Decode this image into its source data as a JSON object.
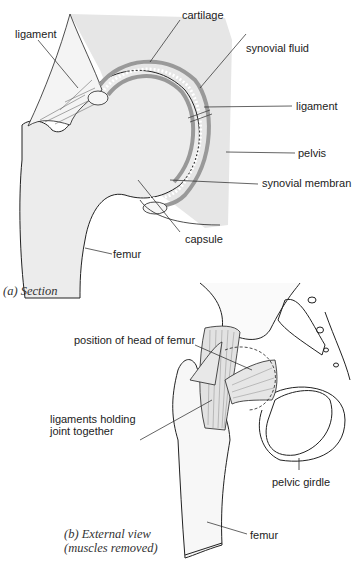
{
  "figure_a": {
    "caption_letter": "(a)",
    "caption_text": "Section",
    "labels": {
      "ligament_left": "ligament",
      "cartilage": "cartilage",
      "synovial_fluid": "synovial fluid",
      "ligament_right": "ligament",
      "pelvis": "pelvis",
      "synovial_membrane": "synovial membran",
      "capsule": "capsule",
      "femur": "femur"
    }
  },
  "figure_b": {
    "caption_letter": "(b)",
    "caption_line1": "External view",
    "caption_line2": "(muscles removed)",
    "labels": {
      "head_position_line1": "position of head of femur",
      "ligaments_line1": "ligaments holding",
      "ligaments_line2": "joint together",
      "pelvic_girdle": "pelvic girdle",
      "femur": "femur"
    }
  },
  "colors": {
    "pelvis_fill": "#e6e6e6",
    "bone_fill": "#ececec",
    "cartilage": "#9a9a9a",
    "line": "#222222"
  }
}
